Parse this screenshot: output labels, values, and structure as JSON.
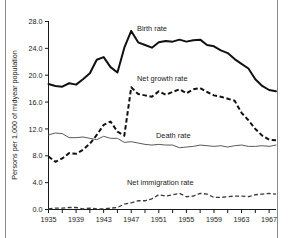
{
  "figure": {
    "background": "#ffffff",
    "border_color": "#8a8a8a"
  },
  "axes": {
    "y_axis_title": "Persons per 1,000 of midyear population",
    "y_ticks": [
      "0.0",
      "4.0",
      "8.0",
      "12.0",
      "16.0",
      "20.0",
      "24.0",
      "28.0"
    ],
    "x_ticks": [
      "1935",
      "1939",
      "1943",
      "1947",
      "1951",
      "1955",
      "1959",
      "1963",
      "1967"
    ]
  },
  "annotations": {
    "birth_rate": "Birth rate",
    "net_growth_rate": "Net growth rate",
    "death_rate": "Death rate",
    "net_immigration_rate": "Net immigration rate"
  },
  "chart_data": {
    "type": "line",
    "title": "",
    "xlabel": "",
    "ylabel": "Persons per 1,000 of midyear population",
    "xlim": [
      1935,
      1968
    ],
    "ylim": [
      0.0,
      28.0
    ],
    "ytick_step": 4.0,
    "xtick_step": 2,
    "xtick_labeled_step": 4,
    "grid": false,
    "legend": "inline-annotations",
    "x": [
      1935,
      1936,
      1937,
      1938,
      1939,
      1940,
      1941,
      1942,
      1943,
      1944,
      1945,
      1946,
      1947,
      1948,
      1949,
      1950,
      1951,
      1952,
      1953,
      1954,
      1955,
      1956,
      1957,
      1958,
      1959,
      1960,
      1961,
      1962,
      1963,
      1964,
      1965,
      1966,
      1967,
      1968
    ],
    "series": [
      {
        "name": "Birth rate",
        "style": "solid-thick",
        "color": "#111111",
        "values": [
          18.7,
          18.4,
          18.3,
          18.8,
          18.6,
          19.4,
          20.3,
          22.3,
          22.7,
          21.2,
          20.4,
          24.1,
          26.6,
          24.9,
          24.5,
          24.1,
          24.9,
          25.1,
          25.0,
          25.3,
          25.0,
          25.2,
          25.3,
          24.5,
          24.3,
          23.7,
          23.3,
          22.4,
          21.7,
          21.0,
          19.4,
          18.4,
          17.8,
          17.6
        ]
      },
      {
        "name": "Net growth rate",
        "style": "dashed-thick",
        "color": "#111111",
        "values": [
          7.9,
          7.1,
          7.6,
          8.4,
          8.3,
          8.9,
          9.8,
          11.1,
          12.6,
          13.1,
          11.6,
          11.0,
          18.2,
          17.2,
          17.0,
          16.8,
          17.6,
          17.1,
          17.5,
          17.9,
          17.3,
          17.9,
          18.1,
          17.5,
          17.0,
          16.8,
          16.5,
          16.2,
          14.4,
          13.3,
          12.0,
          11.0,
          10.4,
          10.3
        ]
      },
      {
        "name": "Death rate",
        "style": "solid-thin",
        "color": "#5a5a5a",
        "values": [
          11.1,
          11.4,
          11.3,
          10.7,
          10.7,
          10.8,
          10.6,
          10.4,
          10.9,
          10.6,
          10.6,
          10.0,
          10.1,
          9.9,
          9.7,
          9.6,
          9.7,
          9.6,
          9.6,
          9.2,
          9.3,
          9.4,
          9.6,
          9.5,
          9.4,
          9.5,
          9.3,
          9.5,
          9.6,
          9.4,
          9.4,
          9.5,
          9.4,
          9.6
        ]
      },
      {
        "name": "Net immigration rate",
        "style": "dashed-thin",
        "color": "#3a3a3a",
        "values": [
          0.1,
          0.2,
          0.2,
          0.3,
          0.3,
          0.1,
          0.2,
          0.1,
          0.1,
          0.2,
          0.3,
          0.8,
          1.0,
          1.3,
          1.3,
          1.6,
          2.2,
          2.0,
          2.2,
          2.4,
          1.9,
          2.0,
          2.4,
          2.3,
          1.8,
          1.8,
          1.9,
          2.0,
          2.0,
          1.9,
          2.2,
          2.3,
          2.4,
          2.3
        ]
      }
    ]
  }
}
